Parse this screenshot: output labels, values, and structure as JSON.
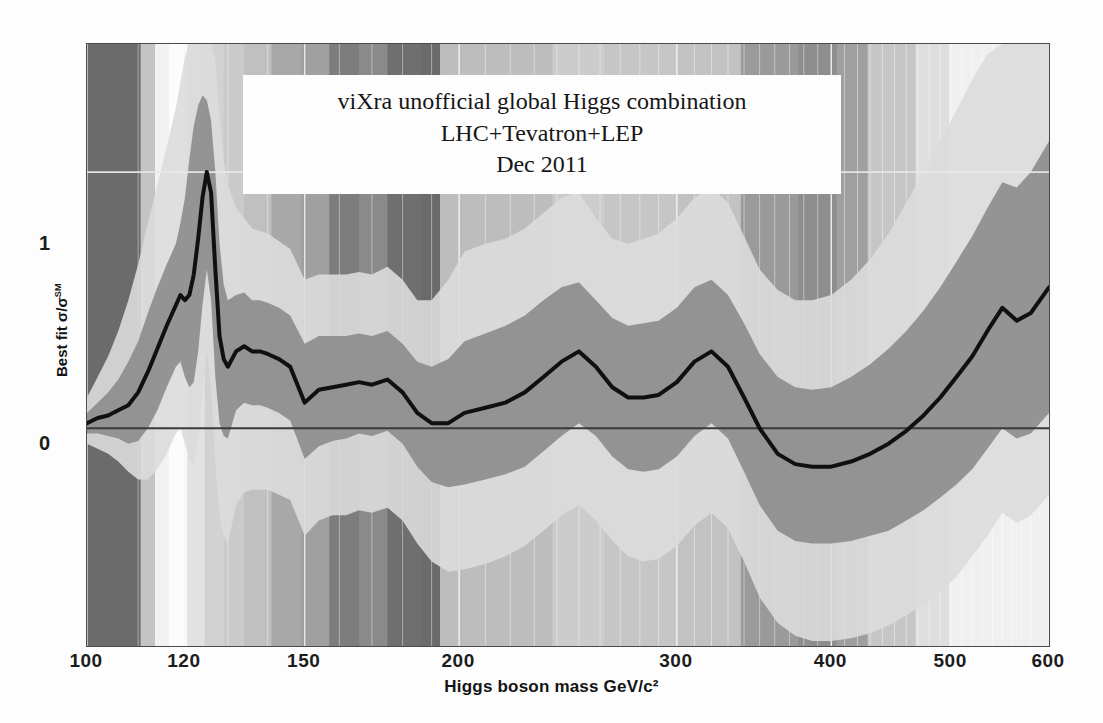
{
  "title": {
    "line1": "viXra unofficial global Higgs combination LHC+Tevatron+LEP",
    "line2": "Dec 2011"
  },
  "axes": {
    "x_title": "Higgs boson mass GeV/c²",
    "y_title_main": "Best fit σ/σ",
    "y_title_sup": "SM",
    "x_ticks": [
      "100",
      "120",
      "150",
      "200",
      "300",
      "400",
      "500",
      "600"
    ],
    "y_ticks": [
      "1",
      "0"
    ]
  },
  "colors": {
    "central_line": "#101010",
    "band_1sigma": "#8f8f8f",
    "band_2sigma": "#dcdcdc",
    "plot_background": "#c9c9c9",
    "gridline": "#e8e8e8",
    "zero_line": "#3a3a3a",
    "frame": "#4a4a4a",
    "title_box": "#fdfdfd"
  },
  "chart_data": {
    "type": "line",
    "title": "viXra unofficial global Higgs combination LHC+Tevatron+LEP Dec 2011",
    "xlabel": "Higgs boson mass GeV/c²",
    "ylabel": "Best fit σ/σSM",
    "xscale": "log",
    "xlim": [
      100,
      600
    ],
    "ylim": [
      -0.85,
      1.5
    ],
    "grid": true,
    "legend": "none",
    "x_tick_values": [
      100,
      120,
      150,
      200,
      300,
      400,
      500,
      600
    ],
    "y_tick_values": [
      0,
      1
    ],
    "x": [
      100,
      102,
      104,
      106,
      108,
      110,
      112,
      114,
      116,
      118,
      119,
      120,
      121,
      122,
      123,
      124,
      125,
      126,
      127,
      128,
      129,
      130,
      132,
      134,
      136,
      138,
      140,
      143,
      146,
      150,
      154,
      158,
      162,
      166,
      170,
      175,
      180,
      185,
      190,
      196,
      202,
      210,
      218,
      226,
      234,
      242,
      250,
      258,
      266,
      274,
      282,
      290,
      300,
      310,
      320,
      330,
      340,
      350,
      362,
      374,
      386,
      400,
      415,
      430,
      445,
      460,
      475,
      490,
      505,
      520,
      535,
      550,
      565,
      580,
      600
    ],
    "series": [
      {
        "name": "best fit",
        "values": [
          0.02,
          0.04,
          0.05,
          0.07,
          0.09,
          0.14,
          0.22,
          0.31,
          0.4,
          0.48,
          0.52,
          0.5,
          0.52,
          0.6,
          0.74,
          0.9,
          1.0,
          0.92,
          0.62,
          0.36,
          0.27,
          0.24,
          0.3,
          0.32,
          0.3,
          0.3,
          0.29,
          0.27,
          0.24,
          0.1,
          0.15,
          0.16,
          0.17,
          0.18,
          0.17,
          0.19,
          0.14,
          0.06,
          0.02,
          0.02,
          0.06,
          0.08,
          0.1,
          0.14,
          0.2,
          0.26,
          0.3,
          0.24,
          0.16,
          0.12,
          0.12,
          0.13,
          0.18,
          0.26,
          0.3,
          0.24,
          0.12,
          0.0,
          -0.1,
          -0.14,
          -0.15,
          -0.15,
          -0.13,
          -0.1,
          -0.06,
          -0.01,
          0.05,
          0.12,
          0.2,
          0.28,
          0.38,
          0.47,
          0.42,
          0.45,
          0.55
        ]
      },
      {
        "name": "+1 sigma",
        "values": [
          0.06,
          0.1,
          0.14,
          0.19,
          0.26,
          0.34,
          0.45,
          0.55,
          0.64,
          0.72,
          0.8,
          0.9,
          1.05,
          1.18,
          1.26,
          1.3,
          1.28,
          1.2,
          1.0,
          0.72,
          0.56,
          0.5,
          0.52,
          0.53,
          0.5,
          0.5,
          0.49,
          0.47,
          0.44,
          0.33,
          0.36,
          0.36,
          0.36,
          0.37,
          0.36,
          0.38,
          0.33,
          0.26,
          0.24,
          0.27,
          0.34,
          0.37,
          0.4,
          0.44,
          0.5,
          0.55,
          0.57,
          0.5,
          0.43,
          0.4,
          0.41,
          0.42,
          0.47,
          0.55,
          0.58,
          0.52,
          0.41,
          0.29,
          0.2,
          0.16,
          0.15,
          0.16,
          0.2,
          0.25,
          0.31,
          0.38,
          0.46,
          0.55,
          0.65,
          0.75,
          0.86,
          0.96,
          0.94,
          1.0,
          1.12
        ]
      },
      {
        "name": "-1 sigma",
        "values": [
          -0.02,
          -0.02,
          -0.03,
          -0.04,
          -0.06,
          -0.05,
          0.0,
          0.07,
          0.16,
          0.24,
          0.26,
          0.2,
          0.16,
          0.18,
          0.3,
          0.48,
          0.62,
          0.5,
          0.2,
          0.02,
          -0.03,
          -0.04,
          0.07,
          0.1,
          0.09,
          0.09,
          0.08,
          0.06,
          0.03,
          -0.12,
          -0.07,
          -0.05,
          -0.04,
          -0.02,
          -0.03,
          -0.01,
          -0.06,
          -0.15,
          -0.21,
          -0.23,
          -0.22,
          -0.2,
          -0.18,
          -0.15,
          -0.09,
          -0.03,
          0.02,
          -0.03,
          -0.11,
          -0.16,
          -0.17,
          -0.16,
          -0.11,
          -0.03,
          0.02,
          -0.04,
          -0.17,
          -0.3,
          -0.4,
          -0.44,
          -0.45,
          -0.45,
          -0.44,
          -0.42,
          -0.4,
          -0.36,
          -0.32,
          -0.27,
          -0.22,
          -0.16,
          -0.08,
          0.0,
          -0.04,
          -0.02,
          0.06
        ]
      },
      {
        "name": "+2 sigma",
        "values": [
          0.12,
          0.2,
          0.28,
          0.38,
          0.5,
          0.64,
          0.8,
          0.95,
          1.1,
          1.25,
          1.35,
          1.45,
          1.5,
          1.5,
          1.5,
          1.5,
          1.5,
          1.5,
          1.44,
          1.22,
          1.05,
          0.95,
          0.86,
          0.82,
          0.78,
          0.77,
          0.76,
          0.73,
          0.7,
          0.58,
          0.6,
          0.6,
          0.6,
          0.61,
          0.6,
          0.63,
          0.58,
          0.5,
          0.5,
          0.58,
          0.69,
          0.72,
          0.74,
          0.78,
          0.84,
          0.9,
          0.92,
          0.82,
          0.74,
          0.72,
          0.74,
          0.76,
          0.82,
          0.9,
          0.94,
          0.88,
          0.75,
          0.62,
          0.54,
          0.5,
          0.5,
          0.52,
          0.58,
          0.66,
          0.76,
          0.88,
          1.0,
          1.12,
          1.24,
          1.36,
          1.46,
          1.5,
          1.5,
          1.5,
          1.5
        ]
      },
      {
        "name": "-2 sigma",
        "values": [
          -0.06,
          -0.08,
          -0.1,
          -0.13,
          -0.17,
          -0.2,
          -0.2,
          -0.16,
          -0.1,
          -0.02,
          0.0,
          -0.06,
          -0.12,
          -0.14,
          -0.05,
          0.14,
          0.3,
          0.16,
          -0.14,
          -0.34,
          -0.42,
          -0.45,
          -0.3,
          -0.25,
          -0.24,
          -0.24,
          -0.24,
          -0.26,
          -0.28,
          -0.42,
          -0.36,
          -0.34,
          -0.34,
          -0.32,
          -0.33,
          -0.31,
          -0.36,
          -0.45,
          -0.52,
          -0.56,
          -0.55,
          -0.53,
          -0.5,
          -0.46,
          -0.4,
          -0.34,
          -0.3,
          -0.36,
          -0.44,
          -0.5,
          -0.52,
          -0.51,
          -0.46,
          -0.38,
          -0.33,
          -0.39,
          -0.52,
          -0.66,
          -0.76,
          -0.81,
          -0.83,
          -0.83,
          -0.82,
          -0.8,
          -0.77,
          -0.73,
          -0.69,
          -0.64,
          -0.58,
          -0.5,
          -0.42,
          -0.33,
          -0.37,
          -0.34,
          -0.26
        ]
      }
    ],
    "background_bands": [
      {
        "x0": 100,
        "x1": 110.5,
        "shade": "#6b6b6b"
      },
      {
        "x0": 110.5,
        "x1": 113.5,
        "shade": "#c4c4c4"
      },
      {
        "x0": 113.5,
        "x1": 116.5,
        "shade": "#f2f2f2"
      },
      {
        "x0": 116.5,
        "x1": 120.5,
        "shade": "#fcfcfc"
      },
      {
        "x0": 120.5,
        "x1": 124.5,
        "shade": "#e2e2e2"
      },
      {
        "x0": 124.5,
        "x1": 129,
        "shade": "#d2d2d2"
      },
      {
        "x0": 129,
        "x1": 134,
        "shade": "#cacaca"
      },
      {
        "x0": 134,
        "x1": 141,
        "shade": "#c0c0c0"
      },
      {
        "x0": 141,
        "x1": 149,
        "shade": "#a8a8a8"
      },
      {
        "x0": 149,
        "x1": 157,
        "shade": "#a0a0a0"
      },
      {
        "x0": 157,
        "x1": 166,
        "shade": "#7d7d7d"
      },
      {
        "x0": 166,
        "x1": 175,
        "shade": "#8a8a8a"
      },
      {
        "x0": 175,
        "x1": 186,
        "shade": "#6f6f6f"
      },
      {
        "x0": 186,
        "x1": 193,
        "shade": "#6b6b6b"
      },
      {
        "x0": 193,
        "x1": 214,
        "shade": "#bdbdbd"
      },
      {
        "x0": 214,
        "x1": 238,
        "shade": "#bdbdbd"
      },
      {
        "x0": 238,
        "x1": 262,
        "shade": "#cccccc"
      },
      {
        "x0": 262,
        "x1": 300,
        "shade": "#c6c6c6"
      },
      {
        "x0": 300,
        "x1": 338,
        "shade": "#c2c2c2"
      },
      {
        "x0": 338,
        "x1": 376,
        "shade": "#9a9a9a"
      },
      {
        "x0": 376,
        "x1": 404,
        "shade": "#8e8e8e"
      },
      {
        "x0": 404,
        "x1": 428,
        "shade": "#9f9f9f"
      },
      {
        "x0": 428,
        "x1": 468,
        "shade": "#c6c6c6"
      },
      {
        "x0": 468,
        "x1": 498,
        "shade": "#dedede"
      },
      {
        "x0": 498,
        "x1": 600,
        "shade": "#f0f0f0"
      }
    ]
  }
}
